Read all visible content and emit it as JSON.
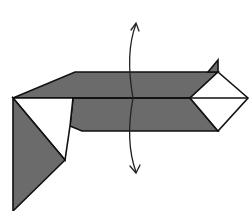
{
  "diagram": {
    "type": "origami-fold-step",
    "colors": {
      "paper_shaded": "#6b6b6b",
      "paper_white": "#ffffff",
      "outline": "#111111"
    },
    "annotations": {
      "fold_arrow": "two-headed curved arrow (fold up and down)"
    }
  }
}
